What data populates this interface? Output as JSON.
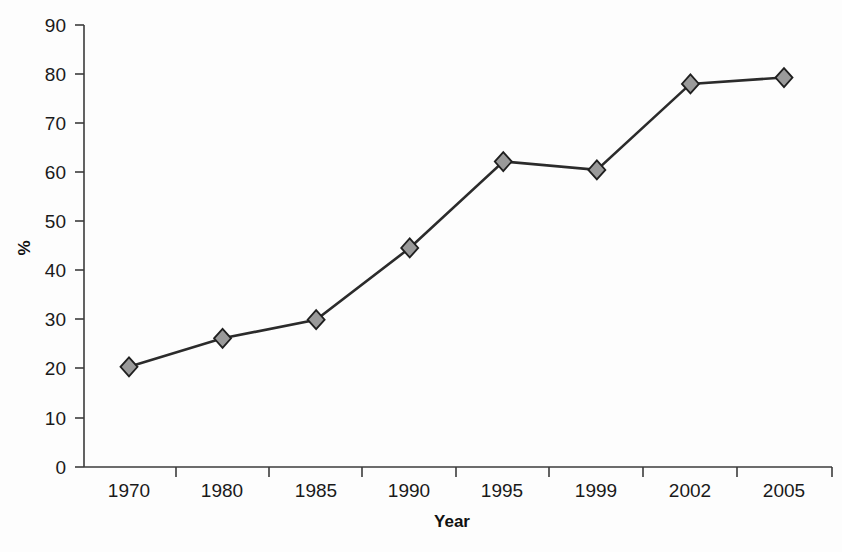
{
  "chart_data": {
    "type": "line",
    "title": "",
    "subtitle": "",
    "xlabel": "Year",
    "ylabel": "%",
    "categories": [
      "1970",
      "1980",
      "1985",
      "1990",
      "1995",
      "1999",
      "2002",
      "2005"
    ],
    "values": [
      20.4,
      26.2,
      30.0,
      44.6,
      62.2,
      60.5,
      78.0,
      79.3
    ],
    "series": [
      {
        "name": "",
        "values": [
          20.4,
          26.2,
          30.0,
          44.6,
          62.2,
          60.5,
          78.0,
          79.3
        ]
      }
    ],
    "ylim": [
      0,
      90
    ],
    "ytick_labels": [
      "0",
      "10",
      "20",
      "30",
      "40",
      "50",
      "60",
      "70",
      "80",
      "90"
    ],
    "ytick_values": [
      0,
      10,
      20,
      30,
      40,
      50,
      60,
      70,
      80,
      90
    ],
    "grid": false,
    "legend": false,
    "legend_position": "none",
    "marker": "diamond",
    "marker_fill_color": "#9a9a9a",
    "marker_edge_color": "#1f1f1f",
    "line_color": "#2b2b2b",
    "axis_color": "#3b3b3b",
    "background_color": "#fdfdfd"
  }
}
